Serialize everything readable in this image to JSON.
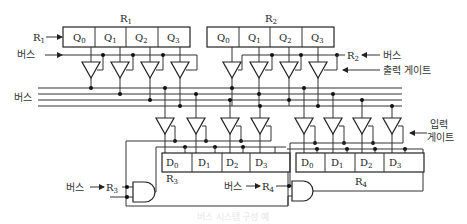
{
  "figure": {
    "registers": {
      "r1": {
        "name": "R",
        "sub": "1",
        "cells": [
          {
            "name": "Q",
            "sub": "0"
          },
          {
            "name": "Q",
            "sub": "1"
          },
          {
            "name": "Q",
            "sub": "2"
          },
          {
            "name": "Q",
            "sub": "3"
          }
        ]
      },
      "r2": {
        "name": "R",
        "sub": "2",
        "cells": [
          {
            "name": "Q",
            "sub": "0"
          },
          {
            "name": "Q",
            "sub": "1"
          },
          {
            "name": "Q",
            "sub": "2"
          },
          {
            "name": "Q",
            "sub": "3"
          }
        ]
      },
      "r3": {
        "name": "R",
        "sub": "3",
        "cells": [
          {
            "name": "D",
            "sub": "0"
          },
          {
            "name": "D",
            "sub": "1"
          },
          {
            "name": "D",
            "sub": "2"
          },
          {
            "name": "D",
            "sub": "3"
          }
        ]
      },
      "r4": {
        "name": "R",
        "sub": "4",
        "cells": [
          {
            "name": "D",
            "sub": "0"
          },
          {
            "name": "D",
            "sub": "1"
          },
          {
            "name": "D",
            "sub": "2"
          },
          {
            "name": "D",
            "sub": "3"
          }
        ]
      }
    },
    "labels": {
      "r1_clock": {
        "name": "R",
        "sub": "1"
      },
      "r1_bus": "버스",
      "r2_control": {
        "name": "R",
        "sub": "2"
      },
      "r2_bus": "버스",
      "output_gate": "출력 게이트",
      "bus": "버스",
      "input_gate_line1": "입력",
      "input_gate_line2": "게이트",
      "r3_bus": "버스",
      "r3_control": {
        "name": "R",
        "sub": "3"
      },
      "r4_bus": "버스",
      "r4_control": {
        "name": "R",
        "sub": "4"
      }
    },
    "caption": "버스 시스템 구성 예"
  }
}
